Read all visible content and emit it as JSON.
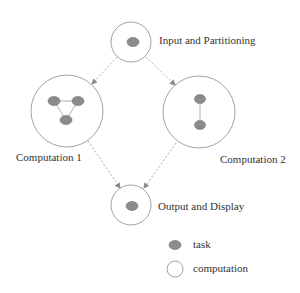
{
  "diagram": {
    "nodes": [
      {
        "id": "input",
        "label": "Input and Partitioning",
        "cx": 131,
        "cy": 42,
        "r": 20,
        "tasks": [
          {
            "cx": 133,
            "cy": 42
          }
        ]
      },
      {
        "id": "comp1",
        "label": "Computation 1",
        "cx": 67,
        "cy": 111,
        "r": 36,
        "tasks": [
          {
            "cx": 54,
            "cy": 101
          },
          {
            "cx": 78,
            "cy": 101
          },
          {
            "cx": 66,
            "cy": 120
          }
        ],
        "task_edges": [
          [
            0,
            1
          ],
          [
            1,
            2
          ],
          [
            2,
            0
          ]
        ]
      },
      {
        "id": "comp2",
        "label": "Computation 2",
        "cx": 199,
        "cy": 112,
        "r": 36,
        "tasks": [
          {
            "cx": 200,
            "cy": 99
          },
          {
            "cx": 200,
            "cy": 125
          }
        ],
        "task_edges": [
          [
            0,
            1
          ]
        ]
      },
      {
        "id": "output",
        "label": "Output and Display",
        "cx": 131,
        "cy": 205,
        "r": 20,
        "tasks": [
          {
            "cx": 132,
            "cy": 205
          }
        ]
      }
    ],
    "flows": [
      {
        "from": "input",
        "to": "comp1"
      },
      {
        "from": "input",
        "to": "comp2"
      },
      {
        "from": "comp1",
        "to": "output"
      },
      {
        "from": "comp2",
        "to": "output"
      }
    ],
    "legend": {
      "task": "task",
      "computation": "computation"
    },
    "colors": {
      "task_fill": "#8c8c8c",
      "circle_stroke": "#8a8a8a",
      "arrow": "#a0a0a0"
    }
  }
}
